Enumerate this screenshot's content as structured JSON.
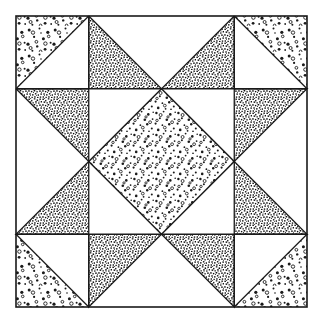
{
  "figure": {
    "kind": "patchwork-block-diagram",
    "caption": ""
  },
  "canvas": {
    "width": 323,
    "height": 324,
    "background": "#ffffff"
  },
  "frame": {
    "label": "outer block border",
    "x": 16,
    "y": 16,
    "width": 291,
    "height": 291,
    "stroke": "#1a1a1a",
    "stroke_width": 1.6,
    "fill": "#ffffff"
  },
  "grid": {
    "columns": 4,
    "rows": 4,
    "cell_size": 72.75,
    "origin_x": 16,
    "origin_y": 16,
    "line_color": "#1a1a1a",
    "line_width": 1.3
  },
  "palette": {
    "ink": "#1a1a1a",
    "paper": "#ffffff",
    "light_stipple": "#2b2b2b",
    "dark_stipple": "#1f1f1f",
    "medium_stipple": "#262626"
  },
  "textures": [
    {
      "id": "dots-light",
      "name": "sparse-ring-dots",
      "density": "low",
      "dot_size": 1.7
    },
    {
      "id": "dots-medium",
      "name": "scattered-dots",
      "density": "medium",
      "dot_size": 1.4
    },
    {
      "id": "speckle-dark",
      "name": "dense-speckle",
      "density": "high",
      "dot_size": 1.0
    }
  ],
  "patches": [
    {
      "name": "corner-tl-outer-triangle",
      "texture": "dots-light",
      "cell": "r0c0",
      "shape": "upper-left-triangle"
    },
    {
      "name": "corner-tl-inner-triangle",
      "texture": "none",
      "cell": "r0c0",
      "shape": "lower-right-triangle"
    },
    {
      "name": "corner-tr-outer-triangle",
      "texture": "dots-light",
      "cell": "r0c3",
      "shape": "upper-right-triangle"
    },
    {
      "name": "corner-tr-inner-triangle",
      "texture": "none",
      "cell": "r0c3",
      "shape": "lower-left-triangle"
    },
    {
      "name": "corner-bl-outer-triangle",
      "texture": "dots-light",
      "cell": "r3c0",
      "shape": "lower-left-triangle"
    },
    {
      "name": "corner-bl-inner-triangle",
      "texture": "none",
      "cell": "r3c0",
      "shape": "upper-right-triangle"
    },
    {
      "name": "corner-br-outer-triangle",
      "texture": "dots-light",
      "cell": "r3c3",
      "shape": "lower-right-triangle"
    },
    {
      "name": "corner-br-inner-triangle",
      "texture": "none",
      "cell": "r3c3",
      "shape": "upper-left-triangle"
    },
    {
      "name": "star-point-top-left-half",
      "texture": "speckle-dark",
      "cell": "r0c1",
      "shape": "star-point"
    },
    {
      "name": "star-point-top-right-half",
      "texture": "speckle-dark",
      "cell": "r0c2",
      "shape": "star-point"
    },
    {
      "name": "star-point-bottom-left-half",
      "texture": "speckle-dark",
      "cell": "r3c1",
      "shape": "star-point"
    },
    {
      "name": "star-point-bottom-right-half",
      "texture": "speckle-dark",
      "cell": "r3c2",
      "shape": "star-point"
    },
    {
      "name": "star-point-left-upper-half",
      "texture": "speckle-dark",
      "cell": "r1c0",
      "shape": "star-point"
    },
    {
      "name": "star-point-left-lower-half",
      "texture": "speckle-dark",
      "cell": "r2c0",
      "shape": "star-point"
    },
    {
      "name": "star-point-right-upper-half",
      "texture": "speckle-dark",
      "cell": "r1c3",
      "shape": "star-point"
    },
    {
      "name": "star-point-right-lower-half",
      "texture": "speckle-dark",
      "cell": "r2c3",
      "shape": "star-point"
    },
    {
      "name": "center-diamond",
      "texture": "dots-medium",
      "cell": "r1c1-r2c2",
      "shape": "diamond"
    },
    {
      "name": "center-corner-tl-triangle",
      "texture": "none",
      "cell": "r1c1",
      "shape": "upper-left-triangle"
    },
    {
      "name": "center-corner-tr-triangle",
      "texture": "none",
      "cell": "r1c2",
      "shape": "upper-right-triangle"
    },
    {
      "name": "center-corner-bl-triangle",
      "texture": "none",
      "cell": "r2c1",
      "shape": "lower-left-triangle"
    },
    {
      "name": "center-corner-br-triangle",
      "texture": "none",
      "cell": "r2c2",
      "shape": "lower-right-triangle"
    }
  ]
}
